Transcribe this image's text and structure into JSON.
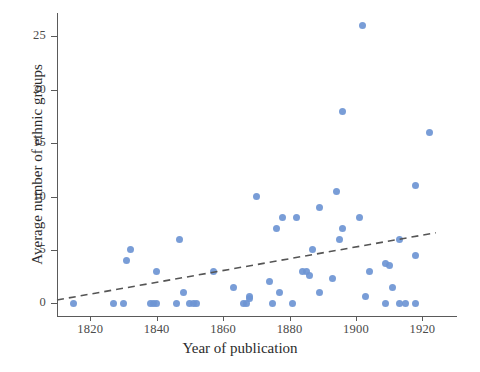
{
  "chart_data": {
    "type": "scatter",
    "title": "",
    "xlabel": "Year of publication",
    "ylabel": "Average number of ethnic groups",
    "xlim": [
      1810,
      1928
    ],
    "ylim": [
      -1.2,
      27.2
    ],
    "xticks": [
      1820,
      1840,
      1860,
      1880,
      1900,
      1920
    ],
    "xticklabels": [
      "1820",
      "1840",
      "1860",
      "1880",
      "1900",
      "1920"
    ],
    "yticks": [
      0,
      5,
      10,
      15,
      20,
      25
    ],
    "yticklabels": [
      "0",
      "5",
      "10",
      "15",
      "20",
      "25"
    ],
    "grid": false,
    "legend": null,
    "marker_color": "#6e95d4",
    "marker_size": 7,
    "points": [
      {
        "x": 1815,
        "y": 0
      },
      {
        "x": 1827,
        "y": 0
      },
      {
        "x": 1830,
        "y": 0
      },
      {
        "x": 1831,
        "y": 4
      },
      {
        "x": 1832,
        "y": 5
      },
      {
        "x": 1838,
        "y": 0
      },
      {
        "x": 1839,
        "y": 0
      },
      {
        "x": 1840,
        "y": 0
      },
      {
        "x": 1840,
        "y": 3
      },
      {
        "x": 1846,
        "y": 0
      },
      {
        "x": 1847,
        "y": 6
      },
      {
        "x": 1848,
        "y": 1
      },
      {
        "x": 1850,
        "y": 0
      },
      {
        "x": 1851,
        "y": 0
      },
      {
        "x": 1852,
        "y": 0
      },
      {
        "x": 1857,
        "y": 3
      },
      {
        "x": 1863,
        "y": 1.5
      },
      {
        "x": 1866,
        "y": 0
      },
      {
        "x": 1867,
        "y": 0
      },
      {
        "x": 1868,
        "y": 0.4
      },
      {
        "x": 1868,
        "y": 0.6
      },
      {
        "x": 1870,
        "y": 10
      },
      {
        "x": 1874,
        "y": 2
      },
      {
        "x": 1875,
        "y": 0
      },
      {
        "x": 1876,
        "y": 7
      },
      {
        "x": 1877,
        "y": 1
      },
      {
        "x": 1878,
        "y": 8
      },
      {
        "x": 1881,
        "y": 0
      },
      {
        "x": 1882,
        "y": 8
      },
      {
        "x": 1884,
        "y": 3
      },
      {
        "x": 1885,
        "y": 3
      },
      {
        "x": 1886,
        "y": 2.6
      },
      {
        "x": 1887,
        "y": 5
      },
      {
        "x": 1889,
        "y": 9
      },
      {
        "x": 1889,
        "y": 1
      },
      {
        "x": 1893,
        "y": 2.3
      },
      {
        "x": 1894,
        "y": 10.5
      },
      {
        "x": 1895,
        "y": 6
      },
      {
        "x": 1896,
        "y": 7
      },
      {
        "x": 1896,
        "y": 18
      },
      {
        "x": 1901,
        "y": 8
      },
      {
        "x": 1902,
        "y": 26
      },
      {
        "x": 1903,
        "y": 0.6
      },
      {
        "x": 1904,
        "y": 3
      },
      {
        "x": 1909,
        "y": 3.7
      },
      {
        "x": 1910,
        "y": 3.5
      },
      {
        "x": 1909,
        "y": 0
      },
      {
        "x": 1911,
        "y": 1.5
      },
      {
        "x": 1913,
        "y": 0
      },
      {
        "x": 1913,
        "y": 6
      },
      {
        "x": 1915,
        "y": 0
      },
      {
        "x": 1918,
        "y": 0
      },
      {
        "x": 1918,
        "y": 11
      },
      {
        "x": 1918,
        "y": 4.5
      },
      {
        "x": 1922,
        "y": 16
      }
    ],
    "trendline": {
      "style": "dashed",
      "color": "#555555",
      "x_start": 1810,
      "y_start": 0.3,
      "x_end": 1924,
      "y_end": 6.6
    }
  }
}
